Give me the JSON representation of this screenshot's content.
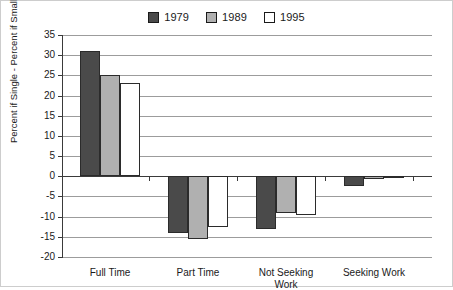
{
  "chart_data": {
    "type": "bar",
    "title": "",
    "subtitle": "",
    "xlabel": "",
    "ylabel": "Percent if Single - Percent if Small Children",
    "ylim": [
      -20,
      35
    ],
    "ytick_step": 5,
    "yticks": [
      "35",
      "30",
      "25",
      "20",
      "15",
      "10",
      "5",
      "0",
      "-5",
      "-10",
      "-15",
      "-20"
    ],
    "grid": true,
    "legend_position": "top-center",
    "categories": [
      "Full Time",
      "Part Time",
      "Not Seeking\nWork",
      "Seeking Work"
    ],
    "series": [
      {
        "name": "1979",
        "color": "#4a4a4a",
        "values": [
          31,
          -14,
          -13,
          -2.5
        ]
      },
      {
        "name": "1989",
        "color": "#b0b0b0",
        "values": [
          25,
          -15.5,
          -9,
          -0.8
        ]
      },
      {
        "name": "1995",
        "color": "#ffffff",
        "values": [
          23,
          -12.5,
          -9.5,
          -0.2
        ]
      }
    ]
  },
  "colors": {
    "series_1979": "#4a4a4a",
    "series_1989": "#b0b0b0",
    "series_1995": "#ffffff",
    "gridline": "#9c9c9c",
    "axis": "#3a3a3a",
    "frame": "#cdcdcd",
    "text": "#1a1a1a"
  }
}
